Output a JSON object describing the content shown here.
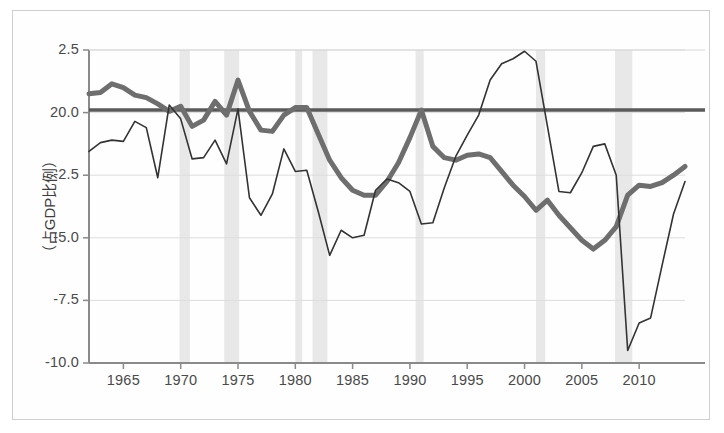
{
  "chart_data": {
    "type": "line",
    "title": "",
    "subtitle": "",
    "xlabel": "",
    "ylabel": "（占GDP比例）",
    "xlim": [
      1962,
      2014
    ],
    "ylim": [
      -10.0,
      2.5
    ],
    "grid": true,
    "legend_position": "none",
    "x_ticks": [
      "1965",
      "1970",
      "1975",
      "1980",
      "1985",
      "1990",
      "1995",
      "2000",
      "2005",
      "2010"
    ],
    "x_tick_values": [
      1965,
      1970,
      1975,
      1980,
      1985,
      1990,
      1995,
      2000,
      2005,
      2010
    ],
    "y_ticks": [
      "2.5",
      "20.0",
      "-2.5",
      "-5.0",
      "-7.5",
      "-10.0"
    ],
    "y_tick_values": [
      2.5,
      0.0,
      -2.5,
      -5.0,
      -7.5,
      -10.0
    ],
    "x": [
      1962,
      1963,
      1964,
      1965,
      1966,
      1967,
      1968,
      1969,
      1970,
      1971,
      1972,
      1973,
      1974,
      1975,
      1976,
      1977,
      1978,
      1979,
      1980,
      1981,
      1982,
      1983,
      1984,
      1985,
      1986,
      1987,
      1988,
      1989,
      1990,
      1991,
      1992,
      1993,
      1994,
      1995,
      1996,
      1997,
      1998,
      1999,
      2000,
      2001,
      2002,
      2003,
      2004,
      2005,
      2006,
      2007,
      2008,
      2009,
      2010,
      2011,
      2012,
      2013,
      2014
    ],
    "series": [
      {
        "name": "thick-gray-series",
        "color": "#6e6e6e",
        "line_width": 5,
        "values": [
          0.75,
          0.8,
          1.15,
          1.0,
          0.7,
          0.6,
          0.35,
          0.05,
          0.25,
          -0.55,
          -0.3,
          0.45,
          -0.1,
          1.3,
          0.05,
          -0.7,
          -0.75,
          -0.1,
          0.2,
          0.2,
          -0.85,
          -1.9,
          -2.6,
          -3.1,
          -3.3,
          -3.3,
          -2.75,
          -2.0,
          -1.0,
          0.1,
          -1.35,
          -1.8,
          -1.9,
          -1.7,
          -1.65,
          -1.8,
          -2.35,
          -2.9,
          -3.35,
          -3.9,
          -3.5,
          -4.1,
          -4.6,
          -5.1,
          -5.45,
          -5.1,
          -4.55,
          -3.3,
          -2.9,
          -2.95,
          -2.8,
          -2.5,
          -2.15
        ]
      },
      {
        "name": "thin-dark-series",
        "color": "#333333",
        "line_width": 1.6,
        "values": [
          -1.55,
          -1.2,
          -1.1,
          -1.15,
          -0.35,
          -0.6,
          -2.6,
          0.3,
          -0.25,
          -1.85,
          -1.8,
          -1.1,
          -2.05,
          0.15,
          -3.4,
          -4.1,
          -3.25,
          -1.45,
          -2.35,
          -2.3,
          -3.95,
          -5.7,
          -4.7,
          -5.0,
          -4.9,
          -3.1,
          -2.65,
          -2.8,
          -3.15,
          -4.45,
          -4.4,
          -3.0,
          -1.75,
          -0.9,
          -0.1,
          1.3,
          1.95,
          2.15,
          2.45,
          2.05,
          -0.55,
          -3.15,
          -3.2,
          -2.4,
          -1.35,
          -1.25,
          -2.5,
          -9.5,
          -8.4,
          -8.2,
          -6.1,
          -4.05,
          -2.75
        ]
      }
    ],
    "reference_line": {
      "name": "zero-line",
      "value": 0.1,
      "color": "#5a5a5a",
      "line_width": 3.5
    },
    "shaded_bands": {
      "name": "recession-bands",
      "color": "#e8e8e8",
      "ranges": [
        [
          1969.9,
          1970.8
        ],
        [
          1973.8,
          1975.1
        ],
        [
          1980.0,
          1980.6
        ],
        [
          1981.5,
          1982.8
        ],
        [
          1990.5,
          1991.2
        ],
        [
          2001.0,
          2001.8
        ],
        [
          2007.9,
          2009.4
        ]
      ]
    }
  }
}
